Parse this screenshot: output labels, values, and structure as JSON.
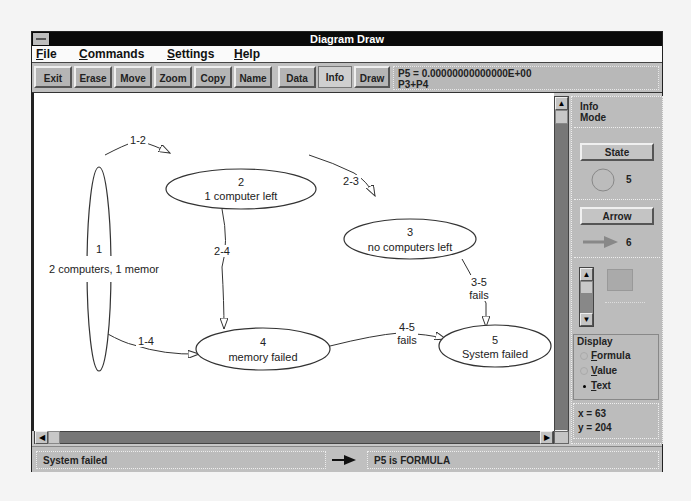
{
  "window": {
    "title": "Diagram Draw"
  },
  "menu": {
    "items": [
      {
        "label": "File",
        "mnemonic": "F"
      },
      {
        "label": "Commands",
        "mnemonic": "C"
      },
      {
        "label": "Settings",
        "mnemonic": "S"
      },
      {
        "label": "Help",
        "mnemonic": "H"
      }
    ]
  },
  "toolbar": {
    "buttons": [
      {
        "label": "Exit"
      },
      {
        "label": "Erase"
      },
      {
        "label": "Move"
      },
      {
        "label": "Zoom"
      },
      {
        "label": "Copy"
      },
      {
        "label": "Name"
      },
      {
        "label": "Data"
      },
      {
        "label": "Info"
      },
      {
        "label": "Draw"
      }
    ],
    "formula_line1": "P5 = 0.00000000000000E+00",
    "formula_line2": "P3+P4"
  },
  "diagram": {
    "states": [
      {
        "id": "1",
        "label": "2 computers, 1 memor"
      },
      {
        "id": "2",
        "label": "1 computer left"
      },
      {
        "id": "3",
        "label": "no computers left"
      },
      {
        "id": "4",
        "label": "memory failed"
      },
      {
        "id": "5",
        "label": "System failed"
      }
    ],
    "arrows": [
      {
        "id": "1-2",
        "label": "1-2",
        "sub": ""
      },
      {
        "id": "2-3",
        "label": "2-3",
        "sub": ""
      },
      {
        "id": "2-4",
        "label": "2-4",
        "sub": ""
      },
      {
        "id": "1-4",
        "label": "1-4",
        "sub": ""
      },
      {
        "id": "3-5",
        "label": "3-5",
        "sub": "fails"
      },
      {
        "id": "4-5",
        "label": "4-5",
        "sub": "fails"
      }
    ]
  },
  "panel": {
    "mode_line1": "Info",
    "mode_line2": "Mode",
    "state_button": "State",
    "state_count": "5",
    "arrow_button": "Arrow",
    "arrow_count": "6",
    "display_label": "Display",
    "display_options": [
      {
        "label": "Formula",
        "selected": false
      },
      {
        "label": "Value",
        "selected": false
      },
      {
        "label": "Text",
        "selected": true
      }
    ],
    "coord_x": "x = 63",
    "coord_y": "y = 204"
  },
  "status": {
    "left": "System failed",
    "right": "P5 is FORMULA"
  }
}
